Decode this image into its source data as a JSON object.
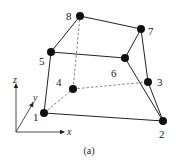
{
  "figure": {
    "caption": "(a)",
    "element": "hexahedral element, 8 nodes",
    "nodes": [
      {
        "id": "1",
        "label": "1",
        "x": 44,
        "y": 113,
        "lx": 33,
        "ly": 121
      },
      {
        "id": "2",
        "label": "2",
        "x": 163,
        "y": 121,
        "lx": 160,
        "ly": 137
      },
      {
        "id": "3",
        "label": "3",
        "x": 148,
        "y": 82,
        "lx": 157,
        "ly": 86
      },
      {
        "id": "4",
        "label": "4",
        "x": 73,
        "y": 89,
        "lx": 56,
        "ly": 86
      },
      {
        "id": "5",
        "label": "5",
        "x": 51,
        "y": 52,
        "lx": 39,
        "ly": 65
      },
      {
        "id": "6",
        "label": "6",
        "x": 125,
        "y": 58,
        "lx": 111,
        "ly": 77
      },
      {
        "id": "7",
        "label": "7",
        "x": 141,
        "y": 29,
        "lx": 148,
        "ly": 35
      },
      {
        "id": "8",
        "label": "8",
        "x": 80,
        "y": 16,
        "lx": 66,
        "ly": 20
      }
    ],
    "solid_edges": [
      [
        "1",
        "2"
      ],
      [
        "1",
        "5"
      ],
      [
        "5",
        "8"
      ],
      [
        "8",
        "7"
      ],
      [
        "7",
        "6"
      ],
      [
        "5",
        "6"
      ],
      [
        "7",
        "3"
      ],
      [
        "3",
        "2"
      ],
      [
        "6",
        "2"
      ]
    ],
    "dashed_edges": [
      [
        "1",
        "4"
      ],
      [
        "4",
        "3"
      ],
      [
        "4",
        "8"
      ]
    ],
    "axes": {
      "x_label": "x",
      "y_label": "y",
      "z_label": "z"
    }
  }
}
